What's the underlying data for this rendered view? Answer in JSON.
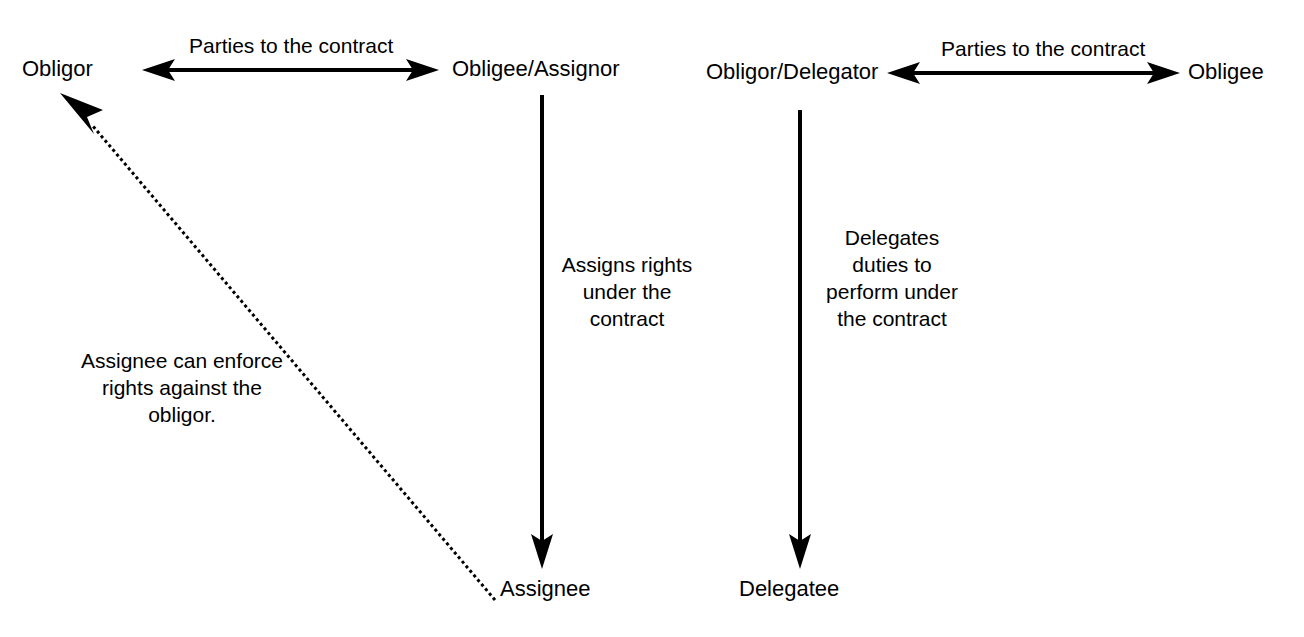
{
  "diagram": {
    "title_partial": "",
    "background_color": "#ffffff",
    "stroke_color": "#000000",
    "nodes": [
      {
        "id": "obligor_left",
        "label": "Obligor"
      },
      {
        "id": "obligee_assignor",
        "label": "Obligee/Assignor"
      },
      {
        "id": "assignee",
        "label": "Assignee"
      },
      {
        "id": "obligor_delegator",
        "label": "Obligor/Delegator"
      },
      {
        "id": "obligee_right",
        "label": "Obligee"
      },
      {
        "id": "delegatee",
        "label": "Delegatee"
      }
    ],
    "edge_labels": {
      "parties_left": "Parties to the contract",
      "parties_right": "Parties to the contract"
    },
    "notes": {
      "assigns_rights": "Assigns rights under the contract",
      "delegates_duties": "Delegates duties to perform under the contract",
      "assignee_enforce": "Assignee can enforce rights against the obligor."
    },
    "edges": [
      {
        "id": "parties-left-arrow",
        "from": "obligor_left",
        "to": "obligee_assignor",
        "style": "solid",
        "arrowheads": "both",
        "label": "Parties to the contract"
      },
      {
        "id": "assigns-arrow",
        "from": "obligee_assignor",
        "to": "assignee",
        "style": "solid",
        "arrowheads": "end",
        "label": "Assigns rights under the contract"
      },
      {
        "id": "enforce-arrow",
        "from": "assignee",
        "to": "obligor_left",
        "style": "dotted",
        "arrowheads": "end",
        "label": "Assignee can enforce rights against the obligor."
      },
      {
        "id": "parties-right-arrow",
        "from": "obligor_delegator",
        "to": "obligee_right",
        "style": "solid",
        "arrowheads": "both",
        "label": "Parties to the contract"
      },
      {
        "id": "delegates-arrow",
        "from": "obligor_delegator",
        "to": "delegatee",
        "style": "solid",
        "arrowheads": "end",
        "label": "Delegates duties to perform under the contract"
      }
    ]
  }
}
